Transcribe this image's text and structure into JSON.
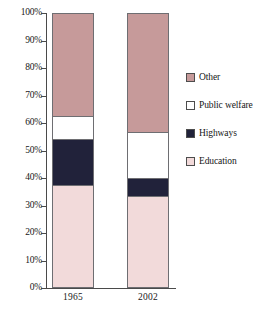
{
  "chart_data": {
    "type": "bar",
    "stacked": true,
    "normalized": "100%",
    "title": "",
    "subtitle": "",
    "xlabel": "",
    "ylabel": "",
    "categories": [
      "1965",
      "2002"
    ],
    "ylim": [
      0,
      100
    ],
    "ytick_labels": [
      "0%",
      "10%",
      "20%",
      "30%",
      "40%",
      "50%",
      "60%",
      "70%",
      "80%",
      "90%",
      "100%"
    ],
    "ytick_values": [
      0,
      10,
      20,
      30,
      40,
      50,
      60,
      70,
      80,
      90,
      100
    ],
    "grid": false,
    "legend_position": "right",
    "series": [
      {
        "name": "Other",
        "color": "#c69a9a",
        "values": [
          37.0,
          43.0
        ],
        "cumulative_top": [
          100.0,
          100.0
        ],
        "cumulative_bottom": [
          63.0,
          57.0
        ]
      },
      {
        "name": "Public welfare",
        "color": "#ffffff",
        "values": [
          8.5,
          16.5
        ],
        "cumulative_top": [
          63.0,
          57.0
        ],
        "cumulative_bottom": [
          54.5,
          40.5
        ]
      },
      {
        "name": "Highways",
        "color": "#21223a",
        "values": [
          16.5,
          6.5
        ],
        "cumulative_top": [
          54.5,
          40.5
        ],
        "cumulative_bottom": [
          38.0,
          34.0
        ]
      },
      {
        "name": "Education",
        "color": "#f2dada",
        "values": [
          38.0,
          34.0
        ],
        "cumulative_top": [
          38.0,
          34.0
        ],
        "cumulative_bottom": [
          0.0,
          0.0
        ]
      }
    ]
  },
  "legend": {
    "entries": [
      {
        "label": "Other",
        "color": "#c69a9a"
      },
      {
        "label": "Public welfare",
        "color": "#ffffff"
      },
      {
        "label": "Highways",
        "color": "#21223a"
      },
      {
        "label": "Education",
        "color": "#f2dada"
      }
    ]
  },
  "axis": {
    "line_color": "#4a4a4a"
  }
}
